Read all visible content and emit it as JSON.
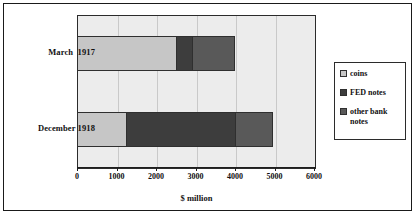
{
  "chart_data": {
    "type": "bar",
    "orientation": "horizontal",
    "stacked": true,
    "title": "",
    "xlabel": "$ million",
    "ylabel": "",
    "xlim": [
      0,
      6000
    ],
    "xticks": [
      0,
      1000,
      2000,
      3000,
      4000,
      5000,
      6000
    ],
    "xtick_labels": [
      "0",
      "1000",
      "2000",
      "3000",
      "4000",
      "5000",
      "6000"
    ],
    "grid": "vertical",
    "legend_position": "right",
    "categories": [
      "March  1917",
      "December 1918"
    ],
    "series": [
      {
        "name": "coins",
        "color": "#c6c6c6",
        "values": [
          2500,
          1250
        ]
      },
      {
        "name": "FED notes",
        "color": "#3d3d3d",
        "values": [
          400,
          2750
        ]
      },
      {
        "name": "other bank notes",
        "color": "#595959",
        "values": [
          1100,
          950
        ]
      }
    ],
    "totals": [
      4000,
      4950
    ],
    "plot_background": "#ececec"
  },
  "legend": {
    "items": [
      {
        "label": "coins"
      },
      {
        "label": "FED notes"
      },
      {
        "label": "other bank notes"
      }
    ]
  }
}
